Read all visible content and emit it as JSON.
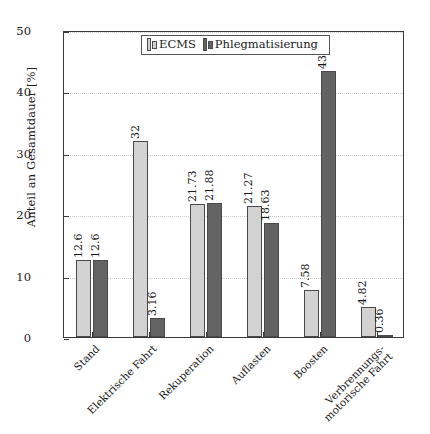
{
  "chart_data": {
    "type": "bar",
    "title": "",
    "xlabel": "",
    "ylabel": "Anteil an Gesamtdauer [%]",
    "ylim": [
      0,
      50
    ],
    "yticks": [
      0,
      10,
      20,
      30,
      40,
      50
    ],
    "grid": true,
    "legend_position": "top-center",
    "categories": [
      "Stand",
      "Elektrische Fahrt",
      "Rekuperation",
      "Auflasten",
      "Boosten",
      "Verbrennungs-motorische Fahrt"
    ],
    "category_lines": [
      [
        "Stand",
        ""
      ],
      [
        "Elektrische Fahrt",
        ""
      ],
      [
        "Rekuperation",
        ""
      ],
      [
        "Auflasten",
        ""
      ],
      [
        "Boosten",
        ""
      ],
      [
        "Verbrennungs-",
        "motorische Fahrt"
      ]
    ],
    "series": [
      {
        "name": "ECMS",
        "color": "#d2d2d2",
        "values": [
          12.6,
          32,
          21.73,
          21.27,
          7.58,
          4.82
        ],
        "labels": [
          "12.6",
          "32",
          "21.73",
          "21.27",
          "7.58",
          "4.82"
        ]
      },
      {
        "name": "Phlegmatisierung",
        "color": "#636363",
        "values": [
          12.6,
          3.16,
          21.88,
          18.63,
          43.37,
          0.36
        ],
        "labels": [
          "12.6",
          "3.16",
          "21.88",
          "18.63",
          "43.37",
          "0.36"
        ]
      }
    ]
  },
  "legend": {
    "entries": [
      {
        "label": "ECMS"
      },
      {
        "label": "Phlegmatisierung"
      }
    ]
  },
  "axis": {
    "y_title": "Anteil an Gesamtdauer [%]",
    "y_tick_labels": [
      "0",
      "10",
      "20",
      "30",
      "40",
      "50"
    ]
  }
}
